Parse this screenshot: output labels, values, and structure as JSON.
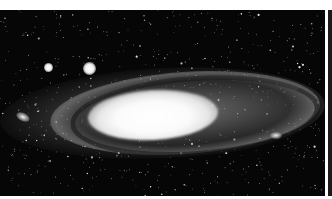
{
  "image": {
    "subject": "Andromeda Galaxy",
    "description": "Black-and-white astronomical photograph of a large tilted spiral galaxy with a bright central core, surrounded by a dense field of stars and two bright companion galaxies to the upper left",
    "palette": {
      "sky": "#060606",
      "core": "#ffffff",
      "arms": "#a0a0a0",
      "margin": "#ffffff"
    },
    "features": [
      {
        "name": "galactic-core",
        "position": "center-left",
        "brightness": "very bright"
      },
      {
        "name": "spiral-arms",
        "position": "elongated ellipse across frame",
        "brightness": "medium"
      },
      {
        "name": "companion-galaxy-small",
        "position": "upper-left"
      },
      {
        "name": "companion-galaxy-large",
        "position": "upper-left, right of small companion"
      },
      {
        "name": "star-field",
        "position": "entire frame"
      }
    ]
  }
}
